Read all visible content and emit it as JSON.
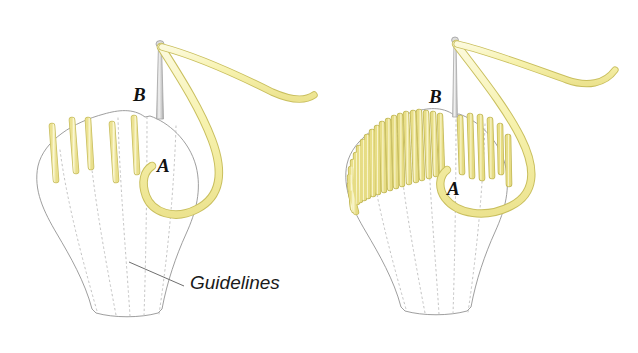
{
  "figure": {
    "kind": "embroidery-stitch-diagram",
    "background_color": "#ffffff",
    "panel_count": 2,
    "caption_labels": {
      "point_a": "A",
      "point_b": "B",
      "guidelines": "Guidelines"
    }
  },
  "colors": {
    "thread_fill": "#f7f2b0",
    "thread_fill_light": "#fbf8d2",
    "thread_outline": "#c9bf5e",
    "stitch_fill": "#f6f1ac",
    "stitch_outline": "#c8be60",
    "needle_body": "#d6d6d6",
    "needle_outline": "#a3a3a3",
    "shape_outline": "#8d8d8d",
    "guideline_dots": "#b9b9b9",
    "leader_line": "#6f6f6f",
    "label_text": "#111111"
  },
  "panels": [
    {
      "id": "panel-left",
      "name": "step-1-first-stitches",
      "description": "Petal outline with five spaced straight stitches worked from the top edge downward; needle emerging at B, thread looping down to A.",
      "stitch_count": 5,
      "stitch_style": "spaced straight stitches",
      "filled_lobe": "none",
      "labels": {
        "a": "A",
        "b": "B",
        "guidelines": "Guidelines"
      },
      "has_guidelines_callout": true,
      "needle": {
        "visible": true,
        "orientation": "vertical",
        "tip_at": "B"
      }
    },
    {
      "id": "panel-right",
      "name": "step-2-filled-stitches",
      "description": "Same petal with the left lobe densely packed with satin stitches and the right lobe showing six spaced stitches; needle at B, thread loop passing A.",
      "stitch_count_dense": 22,
      "stitch_count_spaced": 6,
      "stitch_style": "packed satin stitches plus spaced straight stitches",
      "filled_lobe": "left",
      "labels": {
        "a": "A",
        "b": "B"
      },
      "has_guidelines_callout": false,
      "needle": {
        "visible": true,
        "orientation": "vertical",
        "tip_at": "B"
      }
    }
  ]
}
